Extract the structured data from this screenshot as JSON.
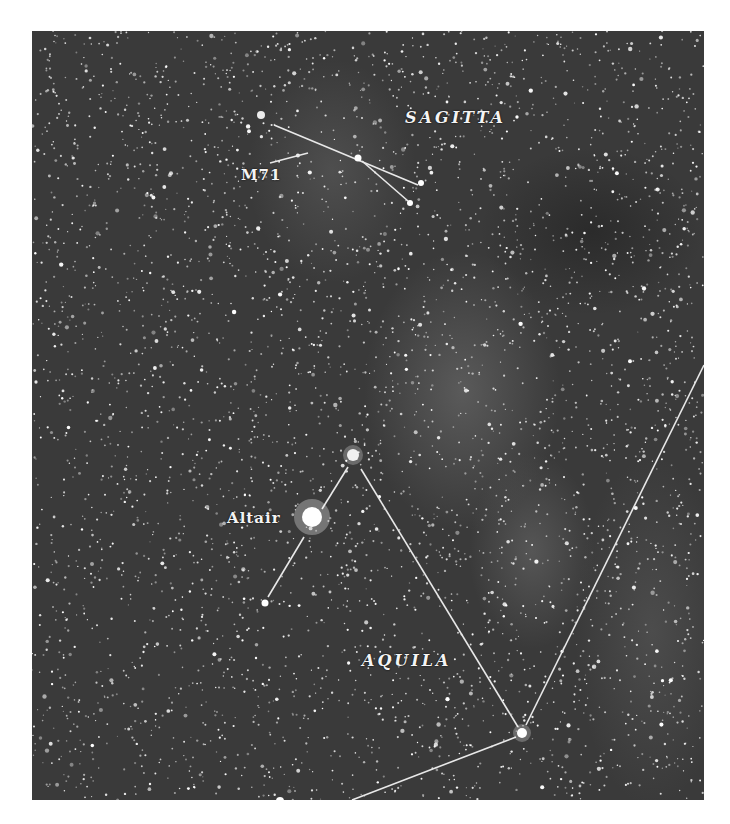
{
  "image": {
    "kind": "astrophotograph",
    "subject": "Star field in the Milky Way with constellation lines"
  },
  "labels": {
    "sagitta": "SAGITTA",
    "m71": "M71",
    "altair": "Altair",
    "aquila": "AQUILA"
  },
  "colors": {
    "sky": "#3a3a3a",
    "lines": "#e8e8e8",
    "text": "#f4f4f4",
    "border": "#ffffff"
  }
}
